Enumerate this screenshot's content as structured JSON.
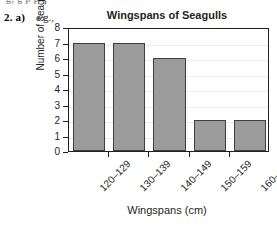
{
  "worksheet": {
    "cut_off_line": "g, g p p",
    "question_number": "2. a)",
    "example_prefix": "e.g.,"
  },
  "chart_data": {
    "type": "bar",
    "title": "Wingspans of Seagulls",
    "xlabel": "Wingspans (cm)",
    "ylabel": "Number of seagulls",
    "categories": [
      "120–129",
      "130–139",
      "140–149",
      "150–159",
      "160–169"
    ],
    "values": [
      7,
      7,
      6,
      2,
      2
    ],
    "ylim": [
      0,
      8
    ],
    "yticks": [
      0,
      1,
      2,
      3,
      4,
      5,
      6,
      7,
      8
    ],
    "ytick_labels": [
      "0",
      "1",
      "2",
      "3",
      "4",
      "5",
      "6",
      "7",
      "8"
    ],
    "grid": true,
    "legend": false,
    "bar_color": "#9b9b9b",
    "bar_edge_color": "#3f3f3f",
    "axis_color": "#231f20",
    "grid_color": "#ececec",
    "background": "#ffffff"
  }
}
